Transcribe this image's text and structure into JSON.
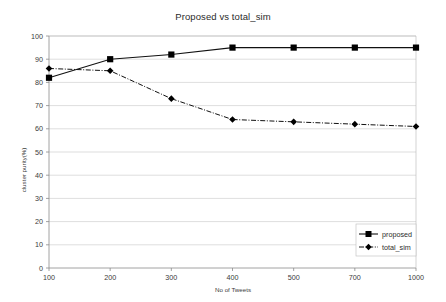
{
  "chart_data": {
    "type": "line",
    "title": "Proposed vs total_sim",
    "xlabel": "No of Tweets",
    "ylabel": "cluster purity(%)",
    "categories": [
      "100",
      "200",
      "300",
      "400",
      "500",
      "700",
      "1000"
    ],
    "ylim": [
      0,
      100
    ],
    "ytick_step": 10,
    "yticks": [
      "0",
      "10",
      "20",
      "30",
      "40",
      "50",
      "60",
      "70",
      "80",
      "90",
      "100"
    ],
    "grid": true,
    "grid_axis": "y",
    "legend_position": "bottom-right-inside",
    "series": [
      {
        "name": "proposed",
        "values": [
          82,
          90,
          92,
          95,
          95,
          95,
          95
        ],
        "line_style": "solid",
        "marker": "square",
        "color": "#111111"
      },
      {
        "name": "total_sim",
        "values": [
          86,
          85,
          73,
          64,
          63,
          62,
          61
        ],
        "line_style": "dash-dot",
        "marker": "diamond",
        "color": "#111111"
      }
    ]
  },
  "legend": {
    "items": [
      {
        "label": "proposed"
      },
      {
        "label": "total_sim"
      }
    ]
  }
}
